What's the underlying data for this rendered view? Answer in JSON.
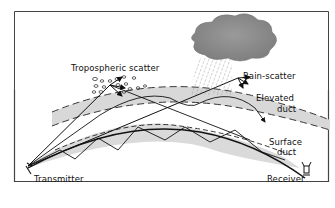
{
  "diagram": {
    "type": "radio-propagation-modes",
    "labels": {
      "tropospheric_scatter": "Tropospheric scatter",
      "rain_scatter": "Rain-scatter",
      "elevated_duct_line1": "Elevated",
      "elevated_duct_line2": "duct",
      "surface_duct_line1": "Surface",
      "surface_duct_line2": "duct",
      "transmitter": "Transmitter",
      "receiver": "Receiver"
    },
    "colors": {
      "frame": "#333333",
      "line": "#111111",
      "duct_fill": "#d6d6d6",
      "cloud": "#8a8a8a"
    }
  }
}
